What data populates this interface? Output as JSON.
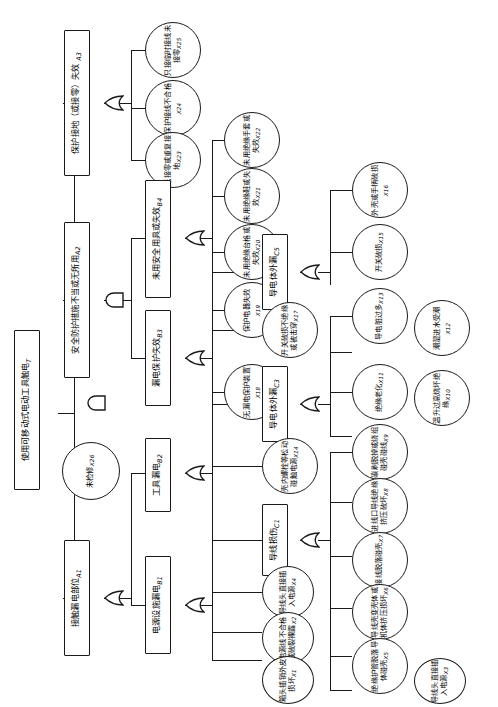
{
  "diagram": {
    "orientation": "rotated-90-ccw",
    "gate_types": {
      "and": "与门",
      "or": "或门"
    },
    "root": {
      "id": "T",
      "label": "使用可移动式电动工具触电",
      "code": "T",
      "shape": "rect"
    },
    "nodes": [
      {
        "id": "A3",
        "label": "保护接地（或接零）失效",
        "code": "A3",
        "shape": "rect"
      },
      {
        "id": "A2",
        "label": "安全防护措施不当或无所用",
        "code": "A2",
        "shape": "rect"
      },
      {
        "id": "X26",
        "label": "未检修",
        "code": "X26",
        "shape": "circle"
      },
      {
        "id": "A1",
        "label": "接触漏电部位",
        "code": "A1",
        "shape": "rect"
      },
      {
        "id": "X25",
        "label": "只接临时接线未接零",
        "code": "X25",
        "shape": "circle"
      },
      {
        "id": "X24",
        "label": "保护接线不合格",
        "code": "X24",
        "shape": "circle"
      },
      {
        "id": "X23",
        "label": "无接零或重复接地",
        "code": "X23",
        "shape": "circle"
      },
      {
        "id": "B4",
        "label": "未用安全用具或失效",
        "code": "B4",
        "shape": "rect"
      },
      {
        "id": "B3",
        "label": "漏电保护失效",
        "code": "B3",
        "shape": "rect"
      },
      {
        "id": "B2",
        "label": "工具漏电",
        "code": "B2",
        "shape": "rect"
      },
      {
        "id": "B1",
        "label": "电源设施漏电",
        "code": "B1",
        "shape": "rect"
      },
      {
        "id": "X22",
        "label": "未用绝缘手套或失效",
        "code": "X22",
        "shape": "circle"
      },
      {
        "id": "X21",
        "label": "未用绝缘鞋或失效",
        "code": "X21",
        "shape": "circle"
      },
      {
        "id": "X20",
        "label": "未用绝缘台格或失效",
        "code": "X20",
        "shape": "circle"
      },
      {
        "id": "X19",
        "label": "保护电器失效",
        "code": "X19",
        "shape": "circle"
      },
      {
        "id": "X18",
        "label": "无漏电保护装置",
        "code": "X18",
        "shape": "circle"
      },
      {
        "id": "C5",
        "label": "导电体外漏",
        "code": "C5",
        "shape": "rect"
      },
      {
        "id": "X17",
        "label": "开关破损不绝缘或被击穿",
        "code": "X17",
        "shape": "circle"
      },
      {
        "id": "C3",
        "label": "导电体外漏",
        "code": "C3",
        "shape": "rect"
      },
      {
        "id": "X14",
        "label": "壳内螺栓等松动碰触电源",
        "code": "X14",
        "shape": "circle"
      },
      {
        "id": "C1",
        "label": "导线损伤",
        "code": "C1",
        "shape": "rect"
      },
      {
        "id": "X4",
        "label": "导线头直接插入电源",
        "code": "X4",
        "shape": "circle"
      },
      {
        "id": "X2",
        "label": "电源线不合格或破裂裸露",
        "code": "X2",
        "shape": "circle"
      },
      {
        "id": "X1",
        "label": "箱头插销外皮损坏",
        "code": "X1",
        "shape": "circle"
      },
      {
        "id": "X16",
        "label": "外壳或手柄破损",
        "code": "X16",
        "shape": "circle"
      },
      {
        "id": "X15",
        "label": "开关破损",
        "code": "X15",
        "shape": "circle"
      },
      {
        "id": "X13",
        "label": "导电脏过多",
        "code": "X13",
        "shape": "circle"
      },
      {
        "id": "X12",
        "label": "潮湿进水受潮",
        "code": "X12",
        "shape": "circle"
      },
      {
        "id": "X11",
        "label": "绝缘老化",
        "code": "X11",
        "shape": "circle"
      },
      {
        "id": "X10",
        "label": "温升过高烧坏绝缘",
        "code": "X10",
        "shape": "circle"
      },
      {
        "id": "X9",
        "label": "碳刷脱掉或绕组碰壳碰线",
        "code": "X9",
        "shape": "circle"
      },
      {
        "id": "X8",
        "label": "进线口导线绝缘挤压破坏",
        "code": "X8",
        "shape": "circle"
      },
      {
        "id": "X7",
        "label": "接线脱落碰壳",
        "code": "X7",
        "shape": "circle"
      },
      {
        "id": "X6",
        "label": "导线壳变壳体或机体挤压损坏",
        "code": "X6",
        "shape": "circle"
      },
      {
        "id": "X5",
        "label": "绝缘护管脱落导体碰壳",
        "code": "X5",
        "shape": "circle"
      },
      {
        "id": "X3",
        "label": "导线头直接插入电源",
        "code": "X3",
        "shape": "circle"
      }
    ],
    "gates": [
      {
        "id": "g-T",
        "type": "and",
        "output": "T"
      },
      {
        "id": "g-A3",
        "type": "or",
        "output": "A3"
      },
      {
        "id": "g-A2",
        "type": "and",
        "output": "A2"
      },
      {
        "id": "g-A1",
        "type": "or",
        "output": "A1"
      },
      {
        "id": "g-B4",
        "type": "or",
        "output": "B4"
      },
      {
        "id": "g-B3",
        "type": "or",
        "output": "B3"
      },
      {
        "id": "g-B2",
        "type": "or",
        "output": "B2"
      },
      {
        "id": "g-B1",
        "type": "or",
        "output": "B1"
      },
      {
        "id": "g-C5",
        "type": "or",
        "output": "C5"
      },
      {
        "id": "g-C3",
        "type": "or",
        "output": "C3"
      },
      {
        "id": "g-C1",
        "type": "or",
        "output": "C1"
      }
    ],
    "edges": [
      {
        "from": "T",
        "to": [
          "A3",
          "A2",
          "X26",
          "A1"
        ]
      },
      {
        "from": "A3",
        "to": [
          "X25",
          "X24",
          "X23"
        ]
      },
      {
        "from": "A2",
        "to": [
          "B4",
          "B3"
        ]
      },
      {
        "from": "A1",
        "to": [
          "B2",
          "B1"
        ]
      },
      {
        "from": "B4",
        "to": [
          "X22",
          "X21",
          "X20"
        ]
      },
      {
        "from": "B3",
        "to": [
          "X19",
          "X18"
        ]
      },
      {
        "from": "B2",
        "to": [
          "C5",
          "X17",
          "C3",
          "X14"
        ]
      },
      {
        "from": "B1",
        "to": [
          "C1",
          "X4",
          "X2",
          "X1"
        ]
      },
      {
        "from": "C5",
        "to": [
          "X16",
          "X15"
        ]
      },
      {
        "from": "C3",
        "to": [
          "X13",
          "X12",
          "X11",
          "X10"
        ]
      },
      {
        "from": "C1",
        "to": [
          "X9",
          "X8",
          "X7",
          "X6",
          "X5",
          "X3"
        ]
      }
    ]
  }
}
